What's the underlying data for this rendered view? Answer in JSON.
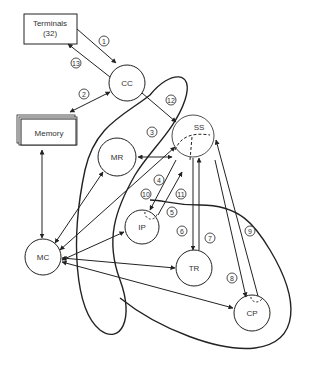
{
  "diagram": {
    "nodes": {
      "terminals": {
        "line1": "Terminals",
        "line2": "(32)"
      },
      "memory": {
        "label": "Memory"
      },
      "cc": {
        "label": "CC"
      },
      "ss": {
        "label": "SS"
      },
      "mr": {
        "label": "MR"
      },
      "ip": {
        "label": "IP"
      },
      "mc": {
        "label": "MC"
      },
      "tr": {
        "label": "TR"
      },
      "cp": {
        "label": "CP"
      }
    },
    "flow_numbers": [
      "1",
      "2",
      "3",
      "4",
      "5",
      "6",
      "7",
      "8",
      "9",
      "10",
      "11",
      "12",
      "13"
    ]
  },
  "colors": {
    "stroke": "#222222",
    "text": "#333333",
    "background": "#ffffff"
  }
}
